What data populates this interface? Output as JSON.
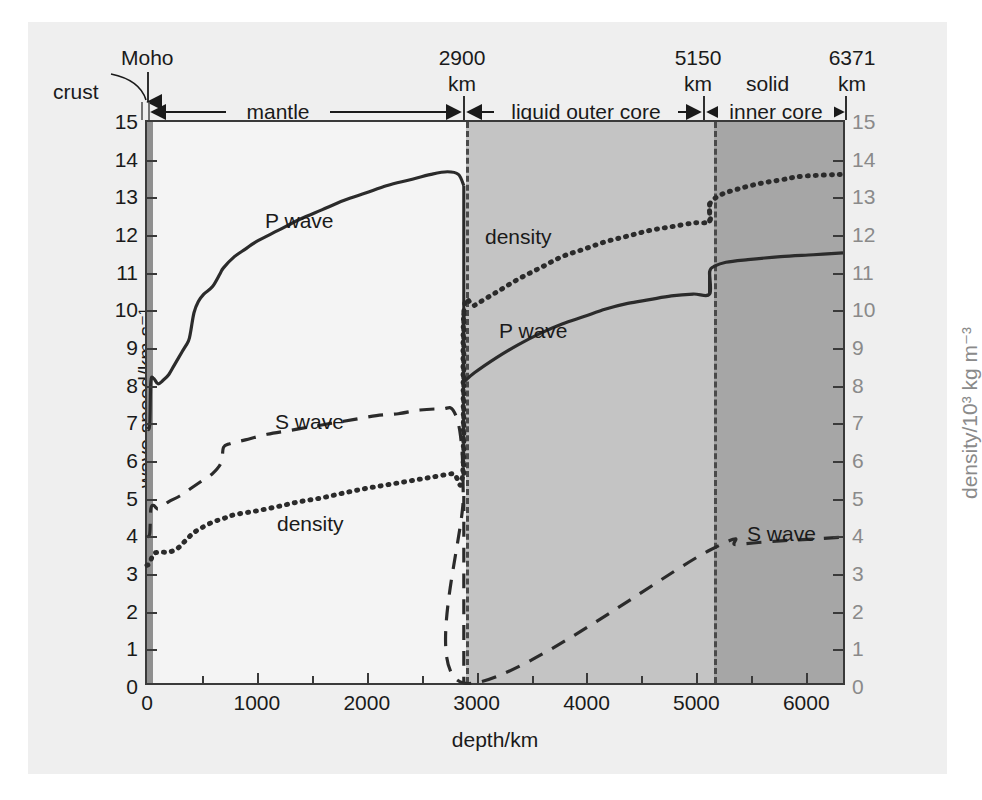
{
  "chart_data": {
    "type": "line",
    "title": "",
    "xlabel": "depth/km",
    "ylabel_left": "wave speed/km s⁻¹",
    "ylabel_right": "density/10³ kg m⁻³",
    "xlim": [
      0,
      6371
    ],
    "ylim": [
      0,
      15
    ],
    "xticks": [
      0,
      1000,
      2000,
      3000,
      4000,
      5000,
      6000
    ],
    "yticks": [
      0,
      1,
      2,
      3,
      4,
      5,
      6,
      7,
      8,
      9,
      10,
      11,
      12,
      13,
      14,
      15
    ],
    "grid": false,
    "legend": "inline-annotations",
    "regions": [
      {
        "name": "crust",
        "start_km": 0,
        "end_km": 35,
        "fill": "#8f8f8f"
      },
      {
        "name": "mantle",
        "start_km": 35,
        "end_km": 2900,
        "fill": "#f4f4f4"
      },
      {
        "name": "liquid outer core",
        "start_km": 2900,
        "end_km": 5150,
        "fill": "#c4c4c4"
      },
      {
        "name": "inner core",
        "start_km": 5150,
        "end_km": 6371,
        "fill": "#a6a6a6"
      }
    ],
    "boundaries_km": [
      2900,
      5150
    ],
    "series": [
      {
        "name": "P wave",
        "style": "solid",
        "points": [
          [
            0,
            6.8
          ],
          [
            25,
            6.9
          ],
          [
            35,
            8.05
          ],
          [
            60,
            8.15
          ],
          [
            100,
            8.0
          ],
          [
            150,
            8.1
          ],
          [
            200,
            8.25
          ],
          [
            250,
            8.5
          ],
          [
            320,
            8.85
          ],
          [
            380,
            9.15
          ],
          [
            400,
            9.4
          ],
          [
            430,
            9.9
          ],
          [
            470,
            10.2
          ],
          [
            520,
            10.4
          ],
          [
            600,
            10.6
          ],
          [
            670,
            10.95
          ],
          [
            700,
            11.1
          ],
          [
            800,
            11.4
          ],
          [
            900,
            11.6
          ],
          [
            1000,
            11.8
          ],
          [
            1200,
            12.1
          ],
          [
            1400,
            12.4
          ],
          [
            1600,
            12.65
          ],
          [
            1800,
            12.9
          ],
          [
            2000,
            13.1
          ],
          [
            2200,
            13.3
          ],
          [
            2400,
            13.45
          ],
          [
            2600,
            13.6
          ],
          [
            2750,
            13.67
          ],
          [
            2850,
            13.6
          ],
          [
            2900,
            13.3
          ],
          [
            2900,
            8.05
          ],
          [
            3000,
            8.3
          ],
          [
            3200,
            8.7
          ],
          [
            3400,
            9.05
          ],
          [
            3600,
            9.35
          ],
          [
            3800,
            9.6
          ],
          [
            4000,
            9.8
          ],
          [
            4200,
            10.0
          ],
          [
            4400,
            10.15
          ],
          [
            4600,
            10.25
          ],
          [
            4800,
            10.35
          ],
          [
            5000,
            10.4
          ],
          [
            5150,
            10.4
          ],
          [
            5150,
            11.0
          ],
          [
            5200,
            11.15
          ],
          [
            5300,
            11.25
          ],
          [
            5500,
            11.32
          ],
          [
            5800,
            11.4
          ],
          [
            6100,
            11.45
          ],
          [
            6371,
            11.5
          ]
        ]
      },
      {
        "name": "S wave",
        "style": "dashed",
        "points": [
          [
            0,
            3.9
          ],
          [
            25,
            4.0
          ],
          [
            35,
            4.65
          ],
          [
            60,
            4.75
          ],
          [
            100,
            4.65
          ],
          [
            150,
            4.75
          ],
          [
            200,
            4.85
          ],
          [
            300,
            5.0
          ],
          [
            400,
            5.2
          ],
          [
            500,
            5.4
          ],
          [
            600,
            5.6
          ],
          [
            680,
            5.9
          ],
          [
            700,
            6.3
          ],
          [
            760,
            6.4
          ],
          [
            900,
            6.5
          ],
          [
            1100,
            6.65
          ],
          [
            1300,
            6.75
          ],
          [
            1500,
            6.85
          ],
          [
            1700,
            6.95
          ],
          [
            1900,
            7.05
          ],
          [
            2100,
            7.15
          ],
          [
            2300,
            7.2
          ],
          [
            2500,
            7.3
          ],
          [
            2700,
            7.33
          ],
          [
            2800,
            7.3
          ],
          [
            2870,
            6.6
          ],
          [
            2895,
            5.0
          ],
          [
            2900,
            0
          ],
          [
            5150,
            3.55
          ],
          [
            5400,
            3.7
          ],
          [
            5800,
            3.8
          ],
          [
            6100,
            3.85
          ],
          [
            6371,
            3.9
          ]
        ]
      },
      {
        "name": "density",
        "style": "dotted",
        "points": [
          [
            0,
            3.15
          ],
          [
            25,
            3.2
          ],
          [
            60,
            3.45
          ],
          [
            120,
            3.5
          ],
          [
            200,
            3.5
          ],
          [
            280,
            3.6
          ],
          [
            350,
            3.8
          ],
          [
            420,
            4.0
          ],
          [
            500,
            4.15
          ],
          [
            600,
            4.3
          ],
          [
            700,
            4.4
          ],
          [
            800,
            4.5
          ],
          [
            1000,
            4.6
          ],
          [
            1200,
            4.72
          ],
          [
            1400,
            4.85
          ],
          [
            1600,
            4.95
          ],
          [
            1800,
            5.08
          ],
          [
            2000,
            5.2
          ],
          [
            2200,
            5.3
          ],
          [
            2400,
            5.4
          ],
          [
            2600,
            5.5
          ],
          [
            2800,
            5.6
          ],
          [
            2890,
            5.6
          ],
          [
            2900,
            9.9
          ],
          [
            3000,
            10.1
          ],
          [
            3200,
            10.45
          ],
          [
            3400,
            10.8
          ],
          [
            3600,
            11.1
          ],
          [
            3800,
            11.4
          ],
          [
            4000,
            11.6
          ],
          [
            4200,
            11.8
          ],
          [
            4400,
            11.95
          ],
          [
            4600,
            12.1
          ],
          [
            4800,
            12.2
          ],
          [
            5000,
            12.3
          ],
          [
            5150,
            12.35
          ],
          [
            5150,
            12.8
          ],
          [
            5250,
            13.05
          ],
          [
            5400,
            13.2
          ],
          [
            5600,
            13.35
          ],
          [
            5800,
            13.45
          ],
          [
            6000,
            13.55
          ],
          [
            6371,
            13.6
          ]
        ]
      }
    ],
    "annotations": [
      {
        "text": "crust",
        "kind": "region-label"
      },
      {
        "text": "Moho",
        "kind": "boundary-label",
        "depth_km": 35
      },
      {
        "text": "2900",
        "kind": "depth-value"
      },
      {
        "text": "km",
        "kind": "depth-unit"
      },
      {
        "text": "5150",
        "kind": "depth-value"
      },
      {
        "text": "km",
        "kind": "depth-unit"
      },
      {
        "text": "solid",
        "kind": "state-label"
      },
      {
        "text": "6371",
        "kind": "depth-value"
      },
      {
        "text": "km",
        "kind": "depth-unit"
      },
      {
        "text": "mantle",
        "kind": "span-label"
      },
      {
        "text": "liquid outer core",
        "kind": "span-label"
      },
      {
        "text": "inner core",
        "kind": "span-label"
      }
    ]
  },
  "axes": {
    "x_label": "depth/km",
    "y_left_label": "wave speed/km s⁻¹",
    "y_right_label": "density/10³ kg m⁻³",
    "x_ticks": [
      "0",
      "1000",
      "2000",
      "3000",
      "4000",
      "5000",
      "6000"
    ],
    "y_ticks": [
      "0",
      "1",
      "2",
      "3",
      "4",
      "5",
      "6",
      "7",
      "8",
      "9",
      "10",
      "11",
      "12",
      "13",
      "14",
      "15"
    ]
  },
  "top_annotations": {
    "crust": "crust",
    "moho": "Moho",
    "d2900": "2900",
    "d2900_unit": "km",
    "d5150": "5150",
    "d5150_unit": "km",
    "solid": "solid",
    "d6371": "6371",
    "d6371_unit": "km",
    "span_mantle": "mantle",
    "span_outer_core": "liquid outer core",
    "span_inner_core": "inner core"
  },
  "series_labels": {
    "p_wave_mantle": "P wave",
    "s_wave_mantle": "S wave",
    "density_mantle": "density",
    "p_wave_core": "P wave",
    "density_core": "density",
    "s_wave_inner": "S wave"
  },
  "colors": {
    "background": "#efefef",
    "mantle_fill": "#f4f4f4",
    "outer_core_fill": "#c4c4c4",
    "inner_core_fill": "#a6a6a6",
    "crust_fill": "#8f8f8f",
    "curve": "#2b2b2b",
    "axis": "#3a3a3a",
    "right_axis_text": "#8a8a8a"
  }
}
